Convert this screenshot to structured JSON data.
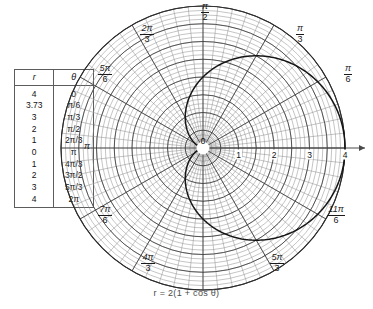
{
  "figure": {
    "caption": "r = 2(1 + cos θ)",
    "curve_name": "cardioid"
  },
  "table": {
    "headers": {
      "r": "r",
      "theta": "θ"
    },
    "rows": [
      {
        "r": "4",
        "theta": "0"
      },
      {
        "r": "3.73",
        "theta": "π/6"
      },
      {
        "r": "3",
        "theta": "π/3"
      },
      {
        "r": "2",
        "theta": "π/2"
      },
      {
        "r": "1",
        "theta": "2π/3"
      },
      {
        "r": "0",
        "theta": "π"
      },
      {
        "r": "1",
        "theta": "4π/3"
      },
      {
        "r": "2",
        "theta": "3π/2"
      },
      {
        "r": "3",
        "theta": "5π/3"
      },
      {
        "r": "4",
        "theta": "2π"
      }
    ]
  },
  "polar": {
    "pole_label": "0",
    "radial_ticks": [
      "1",
      "2",
      "3",
      "4"
    ],
    "angle_labels": [
      {
        "key": "pi_over_2",
        "num": "π",
        "den": "2",
        "whole": null
      },
      {
        "key": "two_pi_3",
        "num": "2π",
        "den": "3",
        "whole": null
      },
      {
        "key": "five_pi_6",
        "num": "5π",
        "den": "6",
        "whole": null
      },
      {
        "key": "pi",
        "num": null,
        "den": null,
        "whole": "π"
      },
      {
        "key": "seven_pi_6",
        "num": "7π",
        "den": "6",
        "whole": null
      },
      {
        "key": "four_pi_3",
        "num": "4π",
        "den": "3",
        "whole": null
      },
      {
        "key": "five_pi_3",
        "num": "5π",
        "den": "3",
        "whole": null
      },
      {
        "key": "eleven_pi_6",
        "num": "11π",
        "den": "6",
        "whole": null
      },
      {
        "key": "pi_over_6",
        "num": "π",
        "den": "6",
        "whole": null
      },
      {
        "key": "pi_over_3",
        "num": "π",
        "den": "3",
        "whole": null
      }
    ]
  },
  "chart_data": {
    "type": "line",
    "coordinate_system": "polar",
    "title": "",
    "subtitle": "",
    "xlabel": "",
    "ylabel": "",
    "equation": "r = 2(1 + cos θ)",
    "curve": "cardioid",
    "grid": true,
    "legend": null,
    "rlim": [
      0,
      4
    ],
    "radial_ticks": [
      1,
      2,
      3,
      4
    ],
    "radial_gridlines": [
      0.5,
      1,
      1.5,
      2,
      2.5,
      3,
      3.5,
      4
    ],
    "angular_ticks_deg": [
      0,
      30,
      60,
      90,
      120,
      150,
      180,
      210,
      240,
      270,
      300,
      330
    ],
    "angular_tick_labels": [
      "0",
      "π/6",
      "π/3",
      "π/2",
      "2π/3",
      "5π/6",
      "π",
      "7π/6",
      "4π/3",
      "3π/2",
      "5π/3",
      "11π/6"
    ],
    "series": [
      {
        "name": "r = 2(1 + cos θ)",
        "theta_labels": [
          "0",
          "π/6",
          "π/3",
          "π/2",
          "2π/3",
          "π",
          "4π/3",
          "3π/2",
          "5π/3",
          "2π"
        ],
        "theta_deg": [
          0,
          30,
          60,
          90,
          120,
          180,
          240,
          270,
          300,
          360
        ],
        "r": [
          4,
          3.73,
          3,
          2,
          1,
          0,
          1,
          2,
          3,
          4
        ]
      }
    ]
  },
  "colors": {
    "grid": "#6b6b6b",
    "curve": "#1a1a1a",
    "axis": "#4a4a4a",
    "table_border": "#5c5c5c",
    "caption": "#4a4a4a"
  }
}
